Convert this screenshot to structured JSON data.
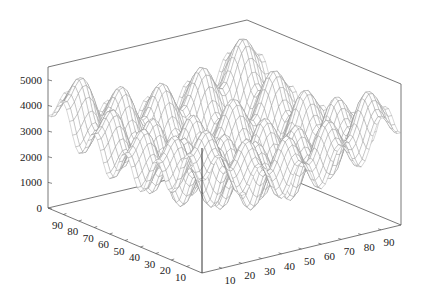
{
  "chart_data": {
    "type": "surface3d",
    "title": "",
    "xlabel": "",
    "ylabel": "",
    "zlabel": "",
    "x_axis": {
      "ticks": [
        10,
        20,
        30,
        40,
        50,
        60,
        70,
        80,
        90
      ],
      "range": [
        0,
        100
      ],
      "position": "front-right edge"
    },
    "y_axis": {
      "ticks": [
        10,
        20,
        30,
        40,
        50,
        60,
        70,
        80,
        90
      ],
      "range": [
        0,
        100
      ],
      "position": "front-left edge"
    },
    "z_axis": {
      "ticks": [
        0,
        1000,
        2000,
        3000,
        4000,
        5000
      ],
      "range": [
        0,
        5500
      ],
      "position": "left vertical edge"
    },
    "surface": {
      "function": "rastrigin-like: z = A*n + sum(u^2 - A*cos(2*pi*u)) with u scaled from grid",
      "grid_resolution": 50,
      "wave_periods_per_axis": 5,
      "min_z_approx": 800,
      "max_z_approx": 5000,
      "mesh_color": "#8c8c8c"
    },
    "grid": false,
    "legend": null
  },
  "axes": {
    "z_ticks": [
      "0",
      "1000",
      "2000",
      "3000",
      "4000",
      "5000"
    ],
    "y_ticks": [
      "90",
      "80",
      "70",
      "60",
      "50",
      "40",
      "30",
      "20",
      "10"
    ],
    "x_ticks": [
      "10",
      "20",
      "30",
      "40",
      "50",
      "60",
      "70",
      "80",
      "90"
    ]
  },
  "colors": {
    "background": "#ffffff",
    "box": "#555555",
    "mesh": "#8c8c8c",
    "text": "#222222"
  }
}
